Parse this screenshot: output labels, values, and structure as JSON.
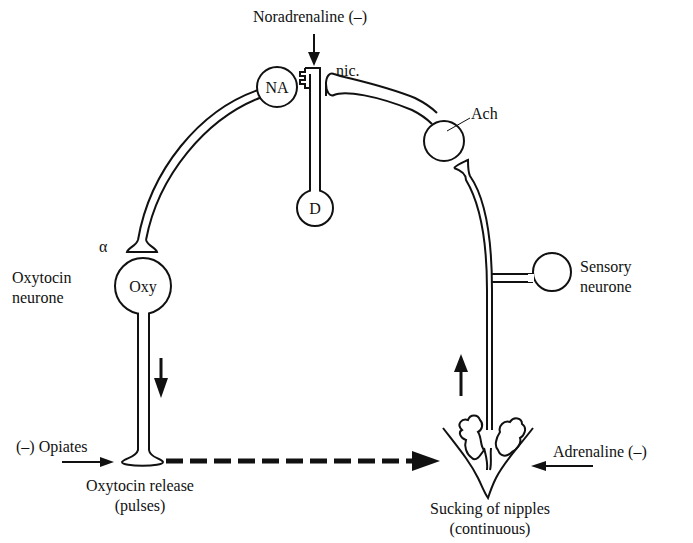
{
  "diagram": {
    "title": "",
    "labels": {
      "noradrenaline": "Noradrenaline (–)",
      "nic": "nic.",
      "ach": "Ach",
      "alpha": "α",
      "oxytocin_neurone_line1": "Oxytocin",
      "oxytocin_neurone_line2": "neurone",
      "sensory_neurone_line1": "Sensory",
      "sensory_neurone_line2": "neurone",
      "opiates": "(–) Opiates",
      "oxytocin_release_line1": "Oxytocin release",
      "oxytocin_release_line2": "(pulses)",
      "adrenaline": "Adrenaline (–)",
      "sucking_line1": "Sucking of nipples",
      "sucking_line2": "(continuous)"
    },
    "cells": {
      "na": "NA",
      "d": "D",
      "oxy": "Oxy"
    },
    "arrows": [
      {
        "name": "noradrenaline-arrow",
        "direction": "down"
      },
      {
        "name": "oxytocin-flow-arrow",
        "direction": "down"
      },
      {
        "name": "sensory-flow-arrow",
        "direction": "up"
      },
      {
        "name": "opiates-arrow",
        "direction": "right"
      },
      {
        "name": "adrenaline-arrow",
        "direction": "left"
      },
      {
        "name": "release-to-sucking-dashed-arrow",
        "direction": "right",
        "style": "dashed"
      }
    ],
    "colors": {
      "ink": "#111111",
      "background": "#ffffff"
    }
  }
}
